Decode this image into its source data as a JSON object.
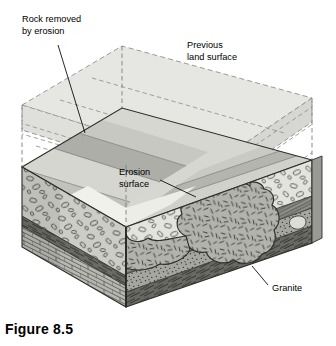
{
  "figure": {
    "caption": "Figure 8.5",
    "kind": "geologic-block-diagram"
  },
  "labels": {
    "rock_removed": {
      "line1": "Rock removed",
      "line2": "by erosion"
    },
    "previous_surface": {
      "line1": "Previous",
      "line2": "land surface"
    },
    "erosion_surface": {
      "line1": "Erosion",
      "line2": "surface"
    },
    "granite": {
      "line1": "Granite"
    }
  },
  "colors": {
    "ink": "#1a1a1a",
    "paper": "#ffffff",
    "ghost_fill": "#e3e3e1",
    "ghost_fill_2": "#dcdcda",
    "ghost_stroke": "#8c8c8c",
    "top_band_a": "#c9c9c4",
    "top_band_b": "#b4b4ae",
    "top_band_c": "#dedeD8",
    "top_band_d": "#a4a49e",
    "erosion_plateau": "#efefea",
    "left_conglomerate": "#cfcfca",
    "front_conglomerate": "#e6e6e0",
    "shale_dark": "#6f6f6a",
    "limestone": "#b9b9b3",
    "sandstone_stipple": "#9d9d97",
    "granite_fill": "#b0b0aa",
    "granite_light": "#e8e8e2",
    "side_dark": "#8a8a84"
  },
  "units": [
    {
      "name": "Previous land surface (eroded away)",
      "pattern": "dashed-ghost"
    },
    {
      "name": "Tilted sedimentary strata",
      "pattern": "banded"
    },
    {
      "name": "Erosion surface",
      "pattern": "plateau"
    },
    {
      "name": "Conglomerate",
      "pattern": "oval-pebbles"
    },
    {
      "name": "Shale",
      "pattern": "dark-laminated"
    },
    {
      "name": "Limestone",
      "pattern": "brick"
    },
    {
      "name": "Sandstone",
      "pattern": "stipple"
    },
    {
      "name": "Granite",
      "pattern": "dash-ticks"
    }
  ]
}
